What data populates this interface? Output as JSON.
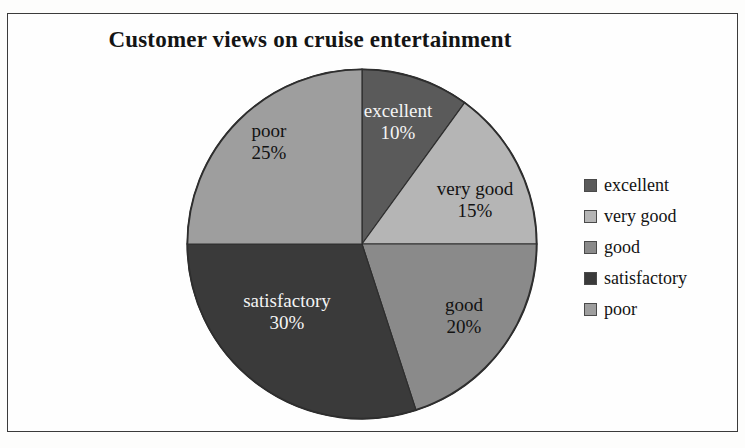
{
  "frame": {
    "border_color": "#3b3b3b",
    "background": "#fefefe"
  },
  "chart_data": {
    "type": "pie",
    "title": "Customer views on cruise entertainment",
    "xlabel": "",
    "ylabel": "",
    "legend_position": "right",
    "start_angle_deg": 0,
    "direction": "clockwise",
    "categories": [
      "excellent",
      "very good",
      "good",
      "satisfactory",
      "poor"
    ],
    "values": [
      10,
      15,
      20,
      30,
      25
    ],
    "value_unit": "%",
    "colors": [
      "#5a5a5a",
      "#b5b5b5",
      "#8a8a8a",
      "#3a3a3a",
      "#9e9e9e"
    ],
    "slices": [
      {
        "label": "excellent",
        "value": 10,
        "value_text": "10%",
        "color": "#5a5a5a",
        "label_color": "light",
        "start_deg": 0,
        "end_deg": 36
      },
      {
        "label": "very good",
        "value": 15,
        "value_text": "15%",
        "color": "#b5b5b5",
        "label_color": "dark",
        "start_deg": 36,
        "end_deg": 90
      },
      {
        "label": "good",
        "value": 20,
        "value_text": "20%",
        "color": "#8a8a8a",
        "label_color": "dark",
        "start_deg": 90,
        "end_deg": 162
      },
      {
        "label": "satisfactory",
        "value": 30,
        "value_text": "30%",
        "color": "#3a3a3a",
        "label_color": "light",
        "start_deg": 162,
        "end_deg": 270
      },
      {
        "label": "poor",
        "value": 25,
        "value_text": "25%",
        "color": "#9e9e9e",
        "label_color": "dark",
        "start_deg": 270,
        "end_deg": 360
      }
    ],
    "legend": [
      {
        "label": "excellent",
        "color": "#5a5a5a"
      },
      {
        "label": "very good",
        "color": "#b5b5b5"
      },
      {
        "label": "good",
        "color": "#8a8a8a"
      },
      {
        "label": "satisfactory",
        "color": "#3a3a3a"
      },
      {
        "label": "poor",
        "color": "#9e9e9e"
      }
    ]
  }
}
